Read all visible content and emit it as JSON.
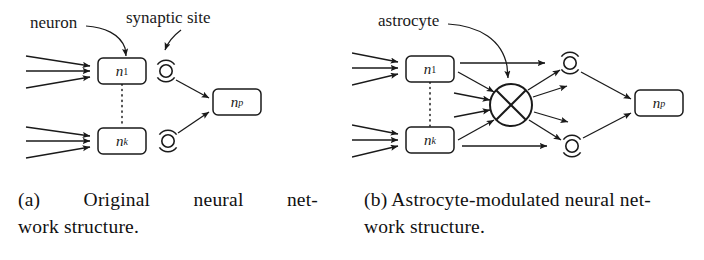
{
  "figure": {
    "background_color": "#ffffff",
    "stroke_color": "#1a1a1a"
  },
  "panel_a": {
    "id": "a",
    "annotations": [
      {
        "name": "neuron",
        "text": "neuron"
      },
      {
        "name": "synaptic-site",
        "text": "synaptic site"
      }
    ],
    "nodes": [
      {
        "name": "n1",
        "base": "n",
        "sub": "1"
      },
      {
        "name": "nk",
        "base": "n",
        "sub": "k"
      },
      {
        "name": "np",
        "base": "n",
        "sub": "p"
      }
    ],
    "synapse_count": 2,
    "input_arrows_per_node": 3,
    "vertical_dots": "dotted",
    "caption": {
      "marker": "(a)",
      "line1": "(a) Original neural net-",
      "line2": "work structure.",
      "full": "(a) Original neural network structure."
    }
  },
  "panel_b": {
    "id": "b",
    "annotations": [
      {
        "name": "astrocyte",
        "text": "astrocyte"
      }
    ],
    "nodes": [
      {
        "name": "n1",
        "base": "n",
        "sub": "1"
      },
      {
        "name": "nk",
        "base": "n",
        "sub": "k"
      },
      {
        "name": "np",
        "base": "n",
        "sub": "p"
      }
    ],
    "astrocyte": {
      "name": "astrocyte-hub",
      "glyph": "crossed-circle",
      "incoming_arrows": 5,
      "outgoing_arrows": 5
    },
    "synapse_count": 2,
    "input_arrows_per_node": 3,
    "vertical_dots": "dotted",
    "caption": {
      "marker": "(b)",
      "line1": "(b) Astrocyte-modulated neural net-",
      "line2": "work structure.",
      "full": "(b) Astrocyte-modulated neural network structure."
    }
  }
}
